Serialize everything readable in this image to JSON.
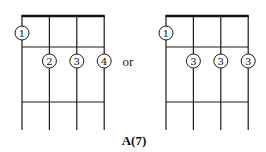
{
  "separator": "or",
  "chord_name": "A(7)",
  "diagrams": [
    {
      "name": "voicing-1",
      "strings": 4,
      "frets": 3,
      "fingers": [
        {
          "string": 1,
          "fret": 1,
          "finger": "1"
        },
        {
          "string": 2,
          "fret": 2,
          "finger": "2"
        },
        {
          "string": 3,
          "fret": 2,
          "finger": "3"
        },
        {
          "string": 4,
          "fret": 2,
          "finger": "4"
        }
      ]
    },
    {
      "name": "voicing-2",
      "strings": 4,
      "frets": 3,
      "fingers": [
        {
          "string": 1,
          "fret": 1,
          "finger": "1"
        },
        {
          "string": 2,
          "fret": 2,
          "finger": "3"
        },
        {
          "string": 3,
          "fret": 2,
          "finger": "3"
        },
        {
          "string": 4,
          "fret": 2,
          "finger": "3"
        }
      ]
    }
  ]
}
